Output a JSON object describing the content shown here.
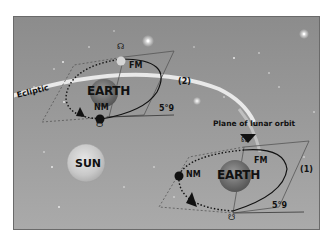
{
  "diagram": {
    "labels": {
      "ecliptic": "Ecliptic",
      "sun": "SUN",
      "plane_of_lunar_orbit": "Plane of lunar orbit"
    },
    "positions": [
      {
        "id": "2",
        "label": "(2)",
        "earth": "EARTH",
        "full_moon": "FM",
        "new_moon": "NM",
        "inclination": "5°9",
        "ascending_node_symbol": "☊",
        "descending_node_symbol": "☋"
      },
      {
        "id": "1",
        "label": "(1)",
        "earth": "EARTH",
        "full_moon": "FM",
        "new_moon": "NM",
        "inclination": "5°9",
        "ascending_node_symbol": "☊",
        "descending_node_symbol": "☋"
      }
    ],
    "colors": {
      "sky": "#999999",
      "ecliptic_band": "#f2f2f2",
      "orbit_line": "#111111",
      "plane_outline": "#555555"
    }
  }
}
